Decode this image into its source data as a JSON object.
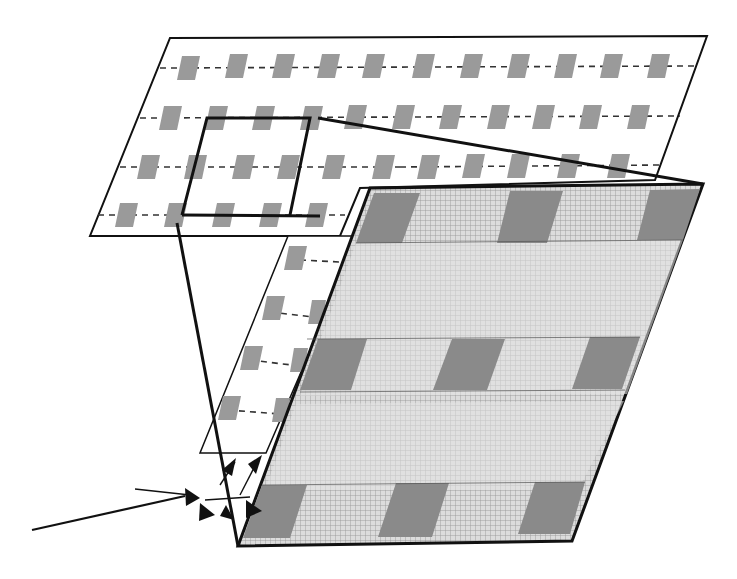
{
  "diagram": {
    "colors": {
      "background": "#ffffff",
      "outline": "#111111",
      "pad": "#9a9a9a",
      "mesh_base": "#d2d2d2",
      "mesh_line": "#8c8c8c",
      "dark_patch": "#8a8a8a"
    },
    "top_layer": {
      "name": "pad-grid-layer",
      "rows": 4,
      "cols": 11
    },
    "bottom_layer": {
      "name": "woven-mesh-layer",
      "patch_rows": 3,
      "patch_cols": 3
    },
    "arrows": {
      "count": 6,
      "incoming_lines": 2
    }
  }
}
